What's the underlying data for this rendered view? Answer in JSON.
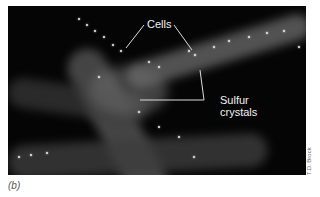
{
  "figure": {
    "panel_label": "(b)",
    "credit": "T.D. Brock",
    "labels": {
      "cells": "Cells",
      "sulfur_line1": "Sulfur",
      "sulfur_line2": "crystals"
    },
    "colors": {
      "background": "#050505",
      "label_text": "#f2f2f2",
      "leader_line": "#dcdcdc"
    }
  }
}
